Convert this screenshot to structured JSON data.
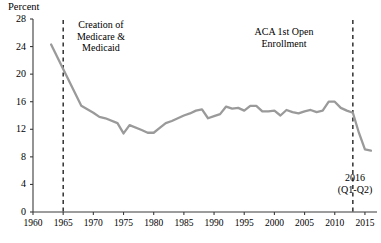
{
  "chart_data": {
    "type": "line",
    "title": "",
    "subtitle": "",
    "xlabel": "",
    "ylabel": "Percent",
    "xlim": [
      1960,
      2017
    ],
    "ylim": [
      0,
      28
    ],
    "yticks": [
      0,
      4,
      8,
      12,
      16,
      20,
      24,
      28
    ],
    "xticks": [
      1960,
      1965,
      1970,
      1975,
      1980,
      1985,
      1990,
      1995,
      2000,
      2005,
      2010,
      2015
    ],
    "grid": false,
    "legend": "none",
    "line_color": "#9a9a9a",
    "series": [
      {
        "name": "Uninsured rate",
        "x": [
          1963,
          1968,
          1970,
          1971,
          1972,
          1974,
          1975,
          1976,
          1978,
          1979,
          1980,
          1981,
          1982,
          1983,
          1984,
          1985,
          1986,
          1987,
          1988,
          1989,
          1990,
          1991,
          1992,
          1993,
          1994,
          1995,
          1996,
          1997,
          1998,
          1999,
          2000,
          2001,
          2002,
          2003,
          2004,
          2005,
          2006,
          2007,
          2008,
          2009,
          2010,
          2011,
          2012,
          2013,
          2014,
          2015,
          2016
        ],
        "values": [
          24.3,
          15.4,
          14.4,
          13.8,
          13.6,
          12.9,
          11.4,
          12.6,
          11.9,
          11.5,
          11.5,
          12.2,
          12.9,
          13.2,
          13.6,
          14.0,
          14.3,
          14.7,
          14.9,
          13.6,
          13.9,
          14.2,
          15.3,
          15.0,
          15.1,
          14.7,
          15.4,
          15.4,
          14.6,
          14.6,
          14.7,
          14.0,
          14.8,
          14.5,
          14.3,
          14.6,
          14.8,
          14.5,
          14.7,
          16.0,
          16.0,
          15.1,
          14.7,
          14.4,
          11.5,
          9.1,
          8.9
        ]
      }
    ],
    "annotations": [
      {
        "id": "medicare",
        "lines": [
          "Creation of",
          "Medicare &",
          "Medicaid"
        ],
        "vline_year": 1965,
        "vline_style": "dashed"
      },
      {
        "id": "aca",
        "lines": [
          "ACA 1st Open",
          "Enrollment"
        ],
        "vline_year": 2013,
        "vline_style": "dashed"
      },
      {
        "id": "endpoint",
        "lines": [
          "2016",
          "(Q1-Q2)"
        ]
      }
    ]
  },
  "labels": {
    "y_axis_title": "Percent",
    "yticks": [
      "0",
      "4",
      "8",
      "12",
      "16",
      "20",
      "24",
      "28"
    ],
    "xticks": [
      "1960",
      "1965",
      "1970",
      "1975",
      "1980",
      "1985",
      "1990",
      "1995",
      "2000",
      "2005",
      "2010",
      "2015"
    ],
    "ann_medicare_l1": "Creation of",
    "ann_medicare_l2": "Medicare &",
    "ann_medicare_l3": "Medicaid",
    "ann_aca_l1": "ACA 1st Open",
    "ann_aca_l2": "Enrollment",
    "ann_2016_l1": "2016",
    "ann_2016_l2": "(Q1-Q2)"
  },
  "colors": {
    "line": "#9a9a9a",
    "axis": "#3b3b3b",
    "text": "#000000"
  }
}
